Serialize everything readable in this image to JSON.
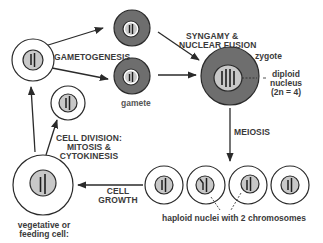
{
  "diagram": {
    "colors": {
      "line": "#2a2a2a",
      "gamete_fill": "#6e6e6e",
      "nucleus_fill": "#c8c8c8",
      "chromosome": "#1e1e1e",
      "text": "#3a3a3a"
    },
    "labels": {
      "gametogenesis": "GAMETOGENESIS",
      "gamete": "gamete",
      "syngamy_line1": "SYNGAMY &",
      "syngamy_line2": "NUCLEAR FUSION",
      "zygote": "zygote",
      "diploid_line1": "diploid",
      "diploid_line2": "nucleus",
      "diploid_line3": "(2n = 4)",
      "meiosis": "MEIOSIS",
      "haploid": "haploid nuclei with 2 chromosomes",
      "cell_growth_line1": "CELL",
      "cell_growth_line2": "GROWTH",
      "cell_division_line1": "CELL DIVISION:",
      "cell_division_line2": "MITOSIS &",
      "cell_division_line3": "CYTOKINESIS",
      "vegetative_line1": "vegetative or",
      "vegetative_line2": "feeding cell:"
    },
    "nodes": [
      {
        "id": "parent-cell",
        "type": "haploid cell",
        "chromosomes": 2
      },
      {
        "id": "gamete-top",
        "type": "gamete",
        "chromosomes": 2
      },
      {
        "id": "gamete-bottom",
        "type": "gamete",
        "chromosomes": 2
      },
      {
        "id": "zygote",
        "type": "diploid zygote",
        "chromosomes": 4
      },
      {
        "id": "haploid-1",
        "type": "haploid cell",
        "chromosomes": 2
      },
      {
        "id": "haploid-2",
        "type": "haploid cell",
        "chromosomes": 2
      },
      {
        "id": "haploid-3",
        "type": "haploid cell",
        "chromosomes": 2
      },
      {
        "id": "haploid-4",
        "type": "haploid cell",
        "chromosomes": 2
      },
      {
        "id": "vegetative-cell",
        "type": "vegetative cell",
        "chromosomes": 2
      },
      {
        "id": "daughter-cell",
        "type": "haploid cell",
        "chromosomes": 2
      }
    ],
    "edges": [
      {
        "from": "parent-cell",
        "to": "gamete-top",
        "label": "GAMETOGENESIS"
      },
      {
        "from": "parent-cell",
        "to": "gamete-bottom",
        "label": "GAMETOGENESIS"
      },
      {
        "from": "gamete-top",
        "to": "zygote",
        "label": "SYNGAMY & NUCLEAR FUSION"
      },
      {
        "from": "gamete-bottom",
        "to": "zygote",
        "label": "SYNGAMY & NUCLEAR FUSION"
      },
      {
        "from": "zygote",
        "to": "haploid-2",
        "label": "MEIOSIS"
      },
      {
        "from": "haploid-1",
        "to": "vegetative-cell",
        "label": "CELL GROWTH"
      },
      {
        "from": "vegetative-cell",
        "to": "daughter-cell",
        "label": "CELL DIVISION: MITOSIS & CYTOKINESIS"
      },
      {
        "from": "vegetative-cell",
        "to": "parent-cell",
        "label": "CELL DIVISION: MITOSIS & CYTOKINESIS"
      }
    ]
  }
}
